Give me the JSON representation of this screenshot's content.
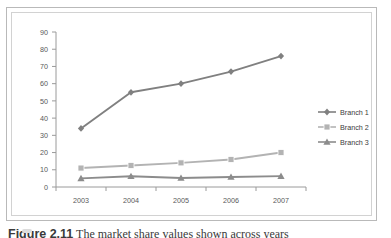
{
  "figure": {
    "caption_prefix": "Figure 2.11",
    "caption_text": "The market share values shown across years"
  },
  "chart_data": {
    "type": "line",
    "title": "",
    "xlabel": "",
    "ylabel": "",
    "categories": [
      "2003",
      "2004",
      "2005",
      "2006",
      "2007"
    ],
    "ylim": [
      0,
      90
    ],
    "yticks": [
      0,
      10,
      20,
      30,
      40,
      50,
      60,
      70,
      80,
      90
    ],
    "grid": false,
    "legend_position": "right",
    "series": [
      {
        "name": "Branch 1",
        "marker": "diamond",
        "color": "#808080",
        "values": [
          34,
          55,
          60,
          67,
          76
        ]
      },
      {
        "name": "Branch 2",
        "marker": "square",
        "color": "#b3b3b3",
        "values": [
          11,
          12.5,
          14,
          16,
          20
        ]
      },
      {
        "name": "Branch 3",
        "marker": "triangle",
        "color": "#8c8c8c",
        "values": [
          5,
          6.2,
          5.2,
          5.8,
          6.3
        ]
      }
    ]
  },
  "colors": {
    "axis": "#9a9a9a",
    "tick_text": "#595959",
    "frame_outer": "#b9b9b9",
    "frame_inner": "#d2d2d2",
    "series_1": "#808080",
    "series_2": "#b3b3b3",
    "series_3": "#8c8c8c"
  }
}
